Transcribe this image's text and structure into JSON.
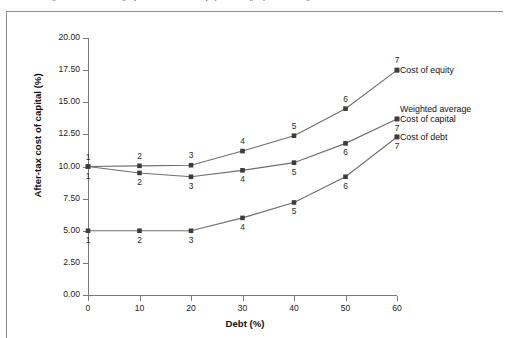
{
  "caption": {
    "text": "of debt financing and, second, increasing capital costs due to bankruptcy and the urgency of refinancing"
  },
  "chart_data": {
    "type": "line",
    "title": "",
    "xlabel": "Debt (%)",
    "ylabel": "After-tax cost of capital (%)",
    "x": [
      0,
      10,
      20,
      30,
      40,
      50,
      60
    ],
    "xlim": [
      0,
      60
    ],
    "ylim": [
      0.0,
      20.0
    ],
    "ytick_labels": [
      "0.00",
      "2.50",
      "5.00",
      "7.50",
      "10.00",
      "12.50",
      "15.00",
      "17.50",
      "20.00"
    ],
    "ytick_values": [
      0.0,
      2.5,
      5.0,
      7.5,
      10.0,
      12.5,
      15.0,
      17.5,
      20.0
    ],
    "xtick_labels": [
      "0",
      "10",
      "20",
      "30",
      "40",
      "50",
      "60"
    ],
    "xtick_values": [
      0,
      10,
      20,
      30,
      40,
      50,
      60
    ],
    "grid": false,
    "point_labels": [
      "1",
      "2",
      "3",
      "4",
      "5",
      "6",
      "7"
    ],
    "marker": "square",
    "series": [
      {
        "name": "Cost of equity",
        "values": [
          10.0,
          10.05,
          10.1,
          11.2,
          12.4,
          14.5,
          17.5
        ],
        "label_position": "above"
      },
      {
        "name": "Weighted average Cost of capital",
        "line1": "Weighted average",
        "line2": "Cost of capital",
        "values": [
          10.0,
          9.5,
          9.2,
          9.7,
          10.3,
          11.8,
          13.7
        ],
        "label_position": "below"
      },
      {
        "name": "Cost of debt",
        "values": [
          5.0,
          5.0,
          5.0,
          6.0,
          7.2,
          9.2,
          12.3
        ],
        "label_position": "below"
      }
    ],
    "legend_position": "right-inline",
    "colors": {
      "line": "#6e6e6e",
      "marker": "#3c3c3c",
      "axis": "#7a7a7a",
      "text": "#111111"
    }
  }
}
